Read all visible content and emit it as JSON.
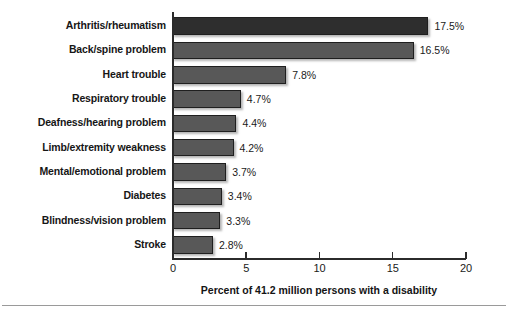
{
  "chart_data": {
    "type": "bar",
    "orientation": "horizontal",
    "title": "",
    "xlabel": "Percent of 41.2 million persons with a disability",
    "ylabel": "",
    "xlim": [
      0,
      20
    ],
    "xticks": [
      "0",
      "5",
      "10",
      "15",
      "20"
    ],
    "grid": false,
    "legend": null,
    "categories": [
      "Arthritis/rheumatism",
      "Back/spine problem",
      "Heart trouble",
      "Respiratory trouble",
      "Deafness/hearing problem",
      "Limb/extremity weakness",
      "Mental/emotional problem",
      "Diabetes",
      "Blindness/vision problem",
      "Stroke"
    ],
    "values": [
      17.5,
      16.5,
      7.8,
      4.7,
      4.4,
      4.2,
      3.7,
      3.4,
      3.3,
      2.8
    ],
    "value_labels": [
      "17.5%",
      "16.5%",
      "7.8%",
      "4.7%",
      "4.4%",
      "4.2%",
      "3.7%",
      "3.4%",
      "3.3%",
      "2.8%"
    ],
    "bar_colors": [
      "#2e2e2e",
      "#585858",
      "#585858",
      "#585858",
      "#585858",
      "#585858",
      "#585858",
      "#585858",
      "#585858",
      "#585858"
    ]
  }
}
